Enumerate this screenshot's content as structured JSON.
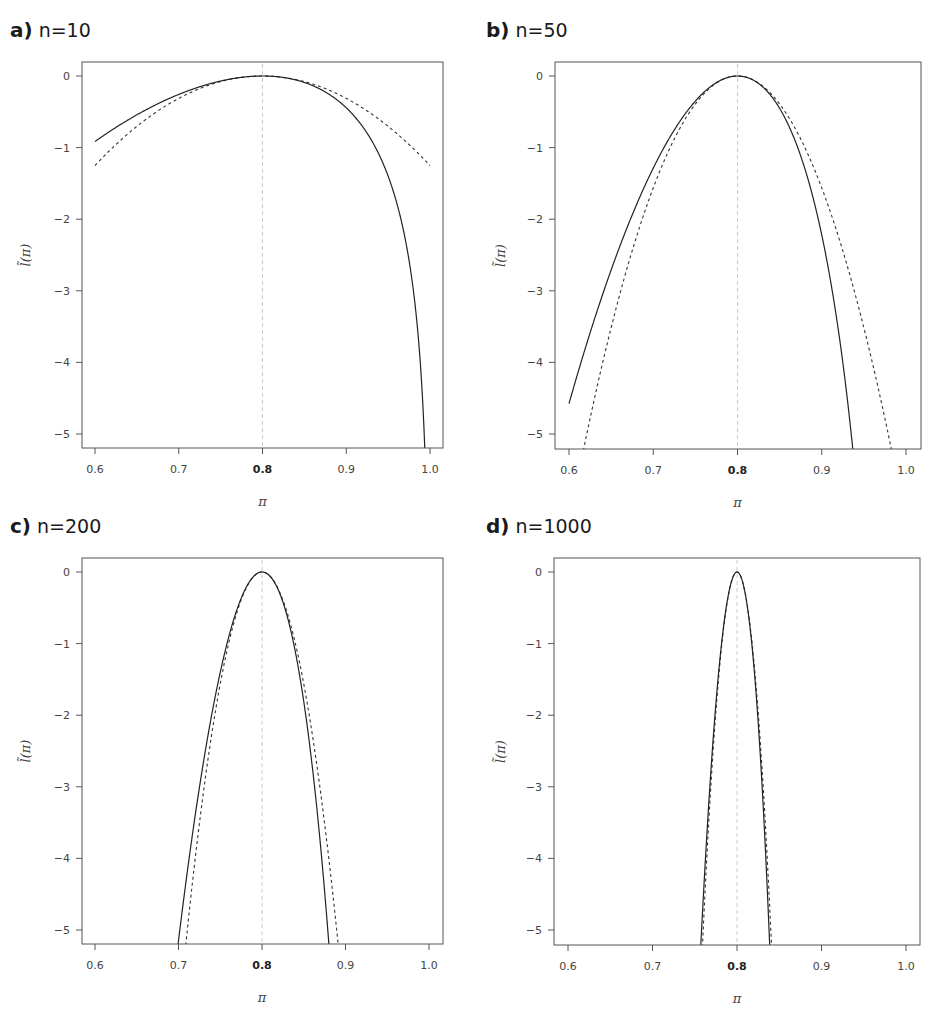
{
  "figure": {
    "panels": [
      {
        "letter": "a)",
        "label": "n=10"
      },
      {
        "letter": "b)",
        "label": "n=50"
      },
      {
        "letter": "c)",
        "label": "n=200"
      },
      {
        "letter": "d)",
        "label": "n=1000"
      }
    ],
    "xlabel": "π",
    "ylabel": "l̃(π)",
    "x_ticks": [
      "0.6",
      "0.7",
      "0.8",
      "0.9",
      "1.0"
    ],
    "y_ticks": [
      "0",
      "−1",
      "−2",
      "−3",
      "−4",
      "−5"
    ],
    "bold_x_tick": "0.8",
    "colors": {
      "solid": "#222222",
      "dashed": "#333333",
      "reference": "#cccccc",
      "frame": "#555555"
    }
  },
  "chart_data": [
    {
      "type": "line",
      "title": "a) n=10",
      "xlabel": "π",
      "ylabel": "l̃(π)",
      "xlim": [
        0.6,
        1.0
      ],
      "ylim": [
        -5,
        0
      ],
      "grid": false,
      "reference_line_x": 0.8,
      "series": [
        {
          "name": "relative log-likelihood (solid)",
          "style": "solid",
          "x": [
            0.6,
            0.65,
            0.7,
            0.75,
            0.8,
            0.85,
            0.9,
            0.95,
            0.98,
            0.99,
            0.995
          ],
          "y": [
            -0.92,
            -0.5,
            -0.22,
            -0.05,
            0.0,
            -0.07,
            -0.34,
            -1.11,
            -2.17,
            -3.12,
            -4.06
          ]
        },
        {
          "name": "quadratic approximation (dashed)",
          "style": "dashed",
          "x": [
            0.6,
            0.65,
            0.7,
            0.75,
            0.8,
            0.85,
            0.9,
            0.95,
            1.0
          ],
          "y": [
            -1.25,
            -0.7,
            -0.31,
            -0.08,
            0.0,
            -0.08,
            -0.31,
            -0.7,
            -1.25
          ]
        }
      ]
    },
    {
      "type": "line",
      "title": "b) n=50",
      "xlabel": "π",
      "ylabel": "l̃(π)",
      "xlim": [
        0.6,
        1.0
      ],
      "ylim": [
        -5,
        0
      ],
      "grid": false,
      "reference_line_x": 0.8,
      "series": [
        {
          "name": "relative log-likelihood (solid)",
          "style": "solid",
          "x": [
            0.6,
            0.65,
            0.7,
            0.75,
            0.8,
            0.85,
            0.9,
            0.936
          ],
          "y": [
            -4.57,
            -2.52,
            -1.12,
            -0.27,
            0.0,
            -0.35,
            -1.72,
            -5.0
          ]
        },
        {
          "name": "quadratic approximation (dashed)",
          "style": "dashed",
          "x": [
            0.619,
            0.65,
            0.7,
            0.75,
            0.8,
            0.85,
            0.9,
            0.95,
            0.981
          ],
          "y": [
            -5.0,
            -3.52,
            -1.56,
            -0.39,
            0.0,
            -0.39,
            -1.56,
            -3.52,
            -5.0
          ]
        }
      ]
    },
    {
      "type": "line",
      "title": "c) n=200",
      "xlabel": "π",
      "ylabel": "l̃(π)",
      "xlim": [
        0.6,
        1.0
      ],
      "ylim": [
        -5,
        0
      ],
      "grid": false,
      "reference_line_x": 0.8,
      "series": [
        {
          "name": "relative log-likelihood (solid)",
          "style": "solid",
          "x": [
            0.699,
            0.72,
            0.75,
            0.8,
            0.85,
            0.87,
            0.88
          ],
          "y": [
            -5.0,
            -3.52,
            -1.08,
            0.0,
            -1.39,
            -3.0,
            -5.0
          ]
        },
        {
          "name": "quadratic approximation (dashed)",
          "style": "dashed",
          "x": [
            0.71,
            0.75,
            0.8,
            0.85,
            0.89
          ],
          "y": [
            -5.0,
            -1.56,
            0.0,
            -1.56,
            -5.0
          ]
        }
      ]
    },
    {
      "type": "line",
      "title": "d) n=1000",
      "xlabel": "π",
      "ylabel": "l̃(π)",
      "xlim": [
        0.6,
        1.0
      ],
      "ylim": [
        -5,
        0
      ],
      "grid": false,
      "reference_line_x": 0.8,
      "series": [
        {
          "name": "relative log-likelihood (solid)",
          "style": "solid",
          "x": [
            0.758,
            0.78,
            0.8,
            0.82,
            0.842
          ],
          "y": [
            -5.0,
            -1.23,
            0.0,
            -1.27,
            -5.0
          ]
        },
        {
          "name": "quadratic approximation (dashed)",
          "style": "dashed",
          "x": [
            0.759,
            0.78,
            0.8,
            0.82,
            0.841
          ],
          "y": [
            -5.0,
            -1.25,
            0.0,
            -1.25,
            -5.0
          ]
        }
      ]
    }
  ]
}
